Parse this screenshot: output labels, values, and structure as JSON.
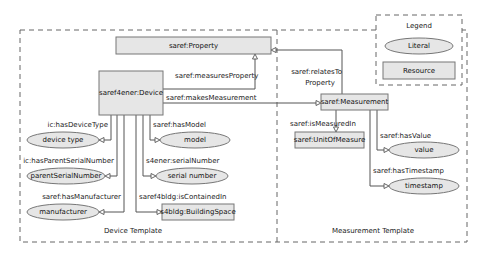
{
  "legend": {
    "title": "Legend",
    "literal_label": "Literal",
    "resource_label": "Resource"
  },
  "templates": {
    "device": "Device Template",
    "measurement": "Measurement Template"
  },
  "resources": {
    "property": "saref:Property",
    "device": "saref4ener:Device",
    "measurement": "saref:Measurement",
    "unit": "saref:UnitOfMeasure",
    "building_space": "s4bldg:BuildingSpace"
  },
  "literals": {
    "device_type": "device type",
    "parent_serial": "parentSerialNumber",
    "manufacturer": "manufacturer",
    "model": "model",
    "serial_number": "serial number",
    "value": "value",
    "timestamp": "timestamp"
  },
  "edges": {
    "measures_property": "saref:measuresProperty",
    "makes_measurement": "saref:makesMeasurement",
    "relates_to_property_1": "saref:relatesTo",
    "relates_to_property_2": "Property",
    "has_device_type": "ic:hasDeviceType",
    "has_parent_serial": "ic:hasParentSerialNumber",
    "has_manufacturer": "saref:hasManufacturer",
    "has_model": "saref:hasModel",
    "serial_number": "s4ener:serialNumber",
    "is_contained_in": "saref4bldg:isContainedIn",
    "is_measured_in": "saref:isMeasuredIn",
    "has_value": "saref:hasValue",
    "has_timestamp": "saref:hasTimestamp"
  },
  "colors": {
    "node_fill": "#e6e6e6",
    "node_stroke": "#777777",
    "edge": "#555555",
    "dashed_border": "#666666"
  }
}
